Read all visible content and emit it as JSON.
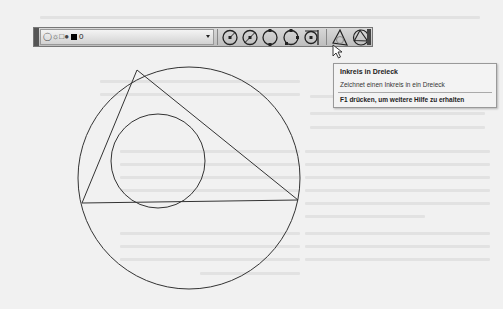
{
  "toolbar": {
    "layer_dropdown": {
      "current_layer": "0",
      "icons": [
        "lightbulb-icon",
        "sun-icon",
        "printer-icon",
        "lock-icon",
        "color-swatch-icon"
      ],
      "swatch_color": "#000000"
    },
    "tools": [
      {
        "name": "circle-center-radius",
        "icon": "circle-center-radius-icon"
      },
      {
        "name": "circle-center-diameter",
        "icon": "circle-center-diameter-icon"
      },
      {
        "name": "circle-2-point",
        "icon": "circle-2-point-icon"
      },
      {
        "name": "circle-3-point",
        "icon": "circle-3-point-icon"
      },
      {
        "name": "circle-tan-tan-radius",
        "icon": "circle-tan-tan-radius-icon"
      },
      {
        "name": "incircle-in-triangle",
        "icon": "incircle-triangle-icon"
      },
      {
        "name": "circumcircle-triangle",
        "icon": "circumcircle-triangle-icon"
      }
    ]
  },
  "tooltip": {
    "title": "Inkreis in Dreieck",
    "description": "Zeichnet einen Inkreis in ein Dreieck",
    "help": "F1 drücken, um weitere Hilfe zu erhalten"
  },
  "drawing": {
    "circumcircle": {
      "cx": 189,
      "cy": 178,
      "r": 111
    },
    "triangle": [
      [
        137,
        70
      ],
      [
        82,
        203
      ],
      [
        298,
        200
      ]
    ],
    "incircle": {
      "cx": 158,
      "cy": 161,
      "r": 47
    },
    "stroke_color": "#333333"
  }
}
